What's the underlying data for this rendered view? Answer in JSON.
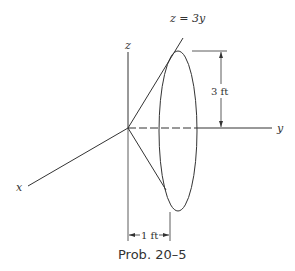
{
  "figure": {
    "caption": "Prob. 20–5",
    "axes": {
      "x_label": "x",
      "y_label": "y",
      "z_label": "z"
    },
    "line_label": "z = 3y",
    "dimensions": {
      "height": "3 ft",
      "depth": "1 ft"
    },
    "colors": {
      "stroke": "#333333",
      "background": "#ffffff"
    }
  }
}
